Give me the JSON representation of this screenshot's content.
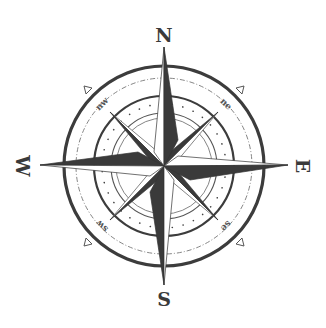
{
  "image": {
    "subject": "compass rose",
    "cardinal_labels": {
      "north": "N",
      "south": "S",
      "east": "E",
      "west": "W"
    },
    "intercardinal_labels": {
      "northeast": "ne",
      "northwest": "nw",
      "southeast": "se",
      "southwest": "sw"
    },
    "colors": {
      "background": "#ffffff",
      "ink_dark": "#3a3a3a",
      "ink_light": "#ffffff",
      "ring": "#444444"
    }
  }
}
